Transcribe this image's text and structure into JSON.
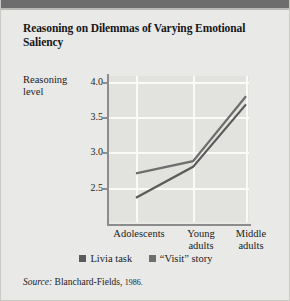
{
  "figure": {
    "title": "Reasoning on Dilemmas of Varying Emotional Saliency",
    "source_word": "Source:",
    "source_text": "Blanchard-Fields,",
    "source_year": "1986."
  },
  "chart_data": {
    "type": "line",
    "title": "Reasoning on Dilemmas of Varying Emotional Saliency",
    "xlabel": "",
    "ylabel": "Reasoning level",
    "categories": [
      "Adolescents",
      "Young adults",
      "Middle adults"
    ],
    "ytick_labels": [
      "4.0",
      "3.5",
      "3.0",
      "2.5"
    ],
    "ytick_values": [
      4.0,
      3.5,
      3.0,
      2.5
    ],
    "ylim": [
      2.3,
      4.1
    ],
    "grid": true,
    "legend_position": "bottom",
    "series": [
      {
        "name": "Livia task",
        "color": "#5a5a5a",
        "values": [
          2.6,
          2.98,
          3.75
        ]
      },
      {
        "name": "“Visit” story",
        "color": "#6e6e6e",
        "values": [
          2.9,
          3.05,
          3.85
        ]
      }
    ]
  },
  "colors": {
    "header_bar": "#6d6d6d",
    "background": "#e9e9e7",
    "plot_background": "#e2e2df",
    "gridline": "#fafaf8",
    "axis": "#8c8c8c"
  }
}
